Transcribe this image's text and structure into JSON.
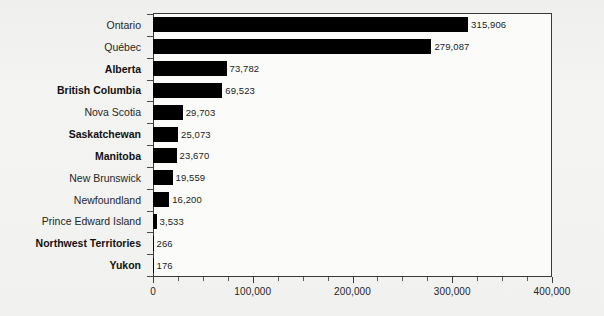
{
  "chart_data": {
    "type": "bar",
    "orientation": "horizontal",
    "title": "",
    "subtitle": "",
    "xlabel": "",
    "ylabel": "",
    "xlim": [
      0,
      400000
    ],
    "grid": false,
    "legend": null,
    "x_tick_labels": [
      "0",
      "100,000",
      "200,000",
      "300,000",
      "400,000"
    ],
    "x_tick_values": [
      0,
      100000,
      200000,
      300000,
      400000
    ],
    "x_minor_tick_interval": 25000,
    "bar_color": "#000000",
    "categories": [
      "Ontario",
      "Québec",
      "Alberta",
      "British Columbia",
      "Nova Scotia",
      "Saskatchewan",
      "Manitoba",
      "New Brunswick",
      "Newfoundland",
      "Prince Edward Island",
      "Northwest Territories",
      "Yukon"
    ],
    "values": [
      315906,
      279087,
      73782,
      69523,
      29703,
      25073,
      23670,
      19559,
      16200,
      3533,
      266,
      176
    ],
    "value_labels": [
      "315,906",
      "279,087",
      "73,782",
      "69,523",
      "29,703",
      "25,073",
      "23,670",
      "19,559",
      "16,200",
      "3,533",
      "266",
      "176"
    ],
    "category_label_bold": [
      false,
      false,
      true,
      true,
      false,
      true,
      true,
      false,
      false,
      false,
      true,
      true
    ]
  }
}
